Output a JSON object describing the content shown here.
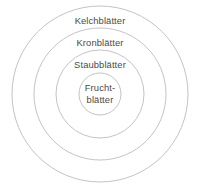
{
  "diagram": {
    "type": "concentric-circles",
    "language": "de",
    "background_color": "#ffffff",
    "stroke_color": "#bcbcbc",
    "text_color": "#4a4a4a",
    "center": {
      "x": 100,
      "y": 94
    },
    "rings": [
      {
        "id": "kelchblaetter",
        "label": "Kelchblätter",
        "radius": 88,
        "order": 1,
        "lines": [
          "Kelchblätter"
        ]
      },
      {
        "id": "kronblaetter",
        "label": "Kronblätter",
        "radius": 66,
        "order": 2,
        "lines": [
          "Kronblätter"
        ]
      },
      {
        "id": "staubblaetter",
        "label": "Staubblätter",
        "radius": 44,
        "order": 3,
        "lines": [
          "Staubblätter"
        ]
      },
      {
        "id": "fruchtblaetter",
        "label": "Fruchtblätter",
        "radius": 21,
        "order": 4,
        "lines": [
          "Frucht-",
          "blätter"
        ]
      }
    ]
  }
}
